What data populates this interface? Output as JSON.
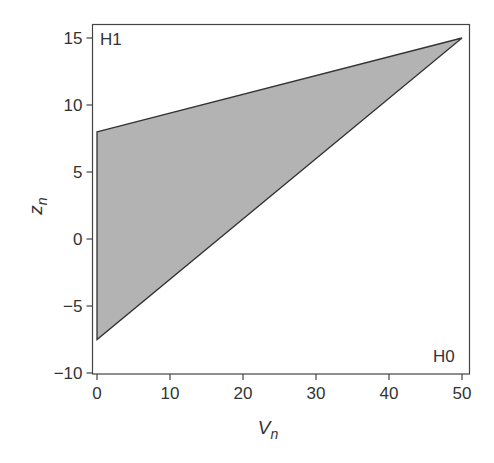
{
  "chart_data": {
    "type": "area",
    "title": "",
    "xlabel": "V_n",
    "ylabel": "z_n",
    "xlabel_main": "V",
    "xlabel_sub": "n",
    "ylabel_main": "z",
    "ylabel_sub": "n",
    "xlim": [
      0,
      50
    ],
    "ylim": [
      -10,
      15
    ],
    "xticks": [
      0,
      10,
      20,
      30,
      40,
      50
    ],
    "yticks": [
      -10,
      -5,
      0,
      5,
      10,
      15
    ],
    "grid": false,
    "legend": null,
    "region": {
      "name": "shaded decision region",
      "fill": "#b3b3b3",
      "edge": "#333333",
      "vertices": [
        [
          0,
          8
        ],
        [
          50,
          15
        ],
        [
          0,
          -7.5
        ]
      ]
    },
    "boundaries": [
      {
        "name": "upper boundary",
        "x": [
          0,
          50
        ],
        "y": [
          8,
          15
        ]
      },
      {
        "name": "lower boundary",
        "x": [
          0,
          50
        ],
        "y": [
          -7.5,
          15
        ]
      }
    ],
    "annotations": [
      {
        "text": "H1",
        "x": 0.5,
        "y": 14.2,
        "position": "top-left"
      },
      {
        "text": "H0",
        "x": 46.3,
        "y": -8.7,
        "position": "bottom-right"
      }
    ]
  },
  "labels": {
    "h1": "H1",
    "h0": "H0",
    "x_main": "V",
    "x_sub": "n",
    "y_main": "z",
    "y_sub": "n"
  },
  "colors": {
    "fill": "#b3b3b3",
    "line": "#333333",
    "axis": "#444444",
    "background": "#ffffff"
  }
}
